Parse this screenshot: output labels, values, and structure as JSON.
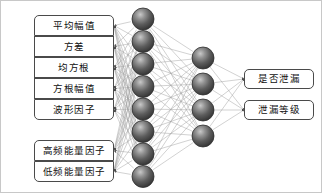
{
  "diagram": {
    "colors": {
      "node_fill_light": "#a8a8a8",
      "node_fill_dark": "#4a4a4a",
      "node_edge": "#2e2e2e",
      "edge_line": "#9a9a9a",
      "box_border": "#4a4a4a",
      "box_background": "#ffffff",
      "text": "#101010",
      "frame": "#c8c8c8"
    },
    "input_layer": {
      "name": "input-feature-boxes",
      "group_a": [
        {
          "label": "平均幅值"
        },
        {
          "label": "方差"
        },
        {
          "label": "均方根"
        },
        {
          "label": "方根幅值"
        },
        {
          "label": "波形因子"
        }
      ],
      "group_b": [
        {
          "label": "高频能量因子"
        },
        {
          "label": "低频能量因子"
        }
      ]
    },
    "hidden_layer_1": {
      "name": "hidden-layer-one",
      "node_count": 8
    },
    "hidden_layer_2": {
      "name": "hidden-layer-two",
      "node_count": 4
    },
    "output_layer": {
      "name": "output-boxes",
      "items": [
        {
          "label": "是否泄漏"
        },
        {
          "label": "泄漏等级"
        }
      ]
    },
    "geometry": {
      "input_box_left": 33,
      "input_box_width": 80,
      "input_box_height": 21,
      "group_a_top": 14,
      "group_b_top": 139,
      "h1_x": 142,
      "h1_top_y": 18,
      "h1_spacing": 22.5,
      "h1_radius": 11,
      "h2_x": 202,
      "h2_top_y": 57,
      "h2_spacing": 26,
      "h2_radius": 11,
      "out_box_left": 243,
      "out_box_width": 70,
      "out_box_height": 20,
      "out_box_top_1": 68,
      "out_box_top_2": 99
    }
  }
}
